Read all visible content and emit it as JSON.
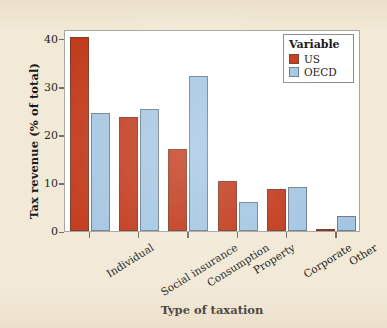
{
  "chart_data": {
    "type": "bar",
    "title": "",
    "xlabel": "Type of taxation",
    "ylabel": "Tax revenue (% of total)",
    "categories": [
      "Individual",
      "Social insurance",
      "Consumption",
      "Property",
      "Corporate",
      "Other"
    ],
    "series": [
      {
        "name": "US",
        "color": "#c1391a",
        "values": [
          40.4,
          23.8,
          17.0,
          10.5,
          8.8,
          0.3
        ]
      },
      {
        "name": "OECD",
        "color": "#a4c6e2",
        "values": [
          24.5,
          25.4,
          32.3,
          6.0,
          9.2,
          3.2
        ]
      }
    ],
    "ylim": [
      0,
      42
    ],
    "yticks": [
      0,
      10,
      20,
      30,
      40
    ],
    "ytick_labels": [
      "0",
      "10",
      "20",
      "30",
      "40"
    ],
    "grid": false,
    "legend": {
      "title": "Variable",
      "position": "top-right",
      "entries": [
        {
          "label": "US",
          "color": "#c1391a"
        },
        {
          "label": "OECD",
          "color": "#a4c6e2"
        }
      ]
    }
  },
  "colors": {
    "page_background": "#f2e9d7",
    "panel_background": "#ffffff",
    "panel_border": "#a6a49e",
    "axis": "#6f6c66",
    "text": "#17161a",
    "us": "#c1391a",
    "oecd": "#a4c6e2"
  }
}
